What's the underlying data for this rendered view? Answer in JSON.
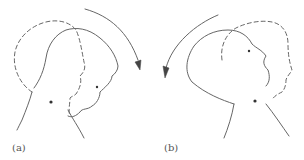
{
  "panels": [
    {
      "id": "a",
      "label": "(a)",
      "rotation": "clockwise",
      "description": "Head tilting forward (flexion) with dashed outline showing displaced position"
    },
    {
      "id": "b",
      "label": "(b)",
      "rotation": "counterclockwise",
      "description": "Head tilting backward (extension) with dashed outline showing displaced position"
    }
  ],
  "colors": {
    "line": "#666666",
    "dot": "#333333",
    "background": "#ffffff"
  }
}
